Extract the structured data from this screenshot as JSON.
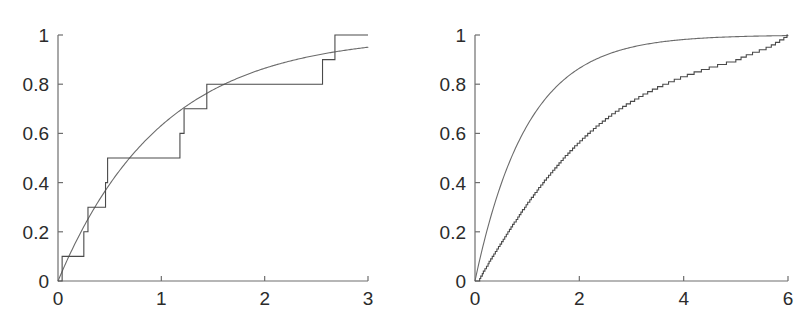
{
  "figure": {
    "title": "",
    "background_color": "#ffffff",
    "panel_count": 2,
    "axis_color": "#6e6e6e",
    "empirical_color": "#4a4a4a",
    "theoretical_color": "#6b6b6b"
  },
  "chart_data": [
    {
      "id": "left-panel",
      "type": "line",
      "title": "",
      "subtitle": "",
      "xlabel": "",
      "ylabel": "",
      "xlim": [
        0,
        3
      ],
      "ylim": [
        0,
        1
      ],
      "grid": false,
      "legend": "none",
      "xticks": [
        0,
        1,
        2,
        3
      ],
      "xticklabels": [
        "0",
        "1",
        "2",
        "3"
      ],
      "yticks": [
        0,
        0.2,
        0.4,
        0.6,
        0.8,
        1
      ],
      "yticklabels": [
        "0",
        "0.2",
        "0.4",
        "0.6",
        "0.8",
        "1"
      ],
      "series": [
        {
          "name": "empirical CDF (step)",
          "style": "step",
          "sample_size": 10,
          "jump_x": [
            0.04,
            0.25,
            0.29,
            0.46,
            0.48,
            1.18,
            1.22,
            1.44,
            2.56,
            2.68
          ],
          "step_values": [
            0.1,
            0.2,
            0.3,
            0.4,
            0.5,
            0.6,
            0.7,
            0.8,
            0.9,
            1.0
          ],
          "x": [
            0,
            0.04,
            0.04,
            0.25,
            0.25,
            0.29,
            0.29,
            0.46,
            0.46,
            0.48,
            0.48,
            1.18,
            1.18,
            1.22,
            1.22,
            1.44,
            1.44,
            2.56,
            2.56,
            2.68,
            2.68,
            3
          ],
          "y": [
            0,
            0,
            0.1,
            0.1,
            0.2,
            0.2,
            0.3,
            0.3,
            0.4,
            0.4,
            0.5,
            0.5,
            0.6,
            0.6,
            0.7,
            0.7,
            0.8,
            0.8,
            0.9,
            0.9,
            1.0,
            1.0
          ]
        },
        {
          "name": "theoretical CDF",
          "style": "smooth",
          "model": "exponential",
          "rate": 1.0,
          "x": [
            0,
            0.1,
            0.2,
            0.3,
            0.4,
            0.5,
            0.6,
            0.7,
            0.8,
            0.9,
            1.0,
            1.2,
            1.4,
            1.6,
            1.8,
            2.0,
            2.2,
            2.4,
            2.6,
            2.8,
            3.0
          ],
          "y": [
            0,
            0.095,
            0.181,
            0.259,
            0.33,
            0.393,
            0.451,
            0.503,
            0.551,
            0.593,
            0.632,
            0.699,
            0.753,
            0.798,
            0.835,
            0.865,
            0.889,
            0.909,
            0.926,
            0.939,
            0.95
          ]
        }
      ]
    },
    {
      "id": "right-panel",
      "type": "line",
      "title": "",
      "subtitle": "",
      "xlabel": "",
      "ylabel": "",
      "xlim": [
        0,
        6
      ],
      "ylim": [
        0,
        1
      ],
      "grid": false,
      "legend": "none",
      "xticks": [
        0,
        2,
        4,
        6
      ],
      "xticklabels": [
        "0",
        "2",
        "4",
        "6"
      ],
      "yticks": [
        0,
        0.2,
        0.4,
        0.6,
        0.8,
        1
      ],
      "yticklabels": [
        "0",
        "0.2",
        "0.4",
        "0.6",
        "0.8",
        "1"
      ],
      "series": [
        {
          "name": "empirical CDF (step)",
          "style": "step",
          "sample_size": 100,
          "jump_x": [
            0.09,
            0.11,
            0.14,
            0.16,
            0.19,
            0.22,
            0.25,
            0.27,
            0.3,
            0.33,
            0.36,
            0.39,
            0.42,
            0.45,
            0.48,
            0.51,
            0.54,
            0.57,
            0.6,
            0.63,
            0.66,
            0.69,
            0.72,
            0.75,
            0.79,
            0.82,
            0.85,
            0.88,
            0.91,
            0.95,
            0.98,
            1.01,
            1.05,
            1.08,
            1.12,
            1.15,
            1.19,
            1.22,
            1.26,
            1.3,
            1.33,
            1.37,
            1.41,
            1.45,
            1.49,
            1.53,
            1.57,
            1.61,
            1.65,
            1.69,
            1.73,
            1.78,
            1.82,
            1.87,
            1.91,
            1.96,
            2.01,
            2.06,
            2.11,
            2.16,
            2.21,
            2.27,
            2.32,
            2.38,
            2.44,
            2.5,
            2.56,
            2.62,
            2.69,
            2.76,
            2.83,
            2.9,
            2.98,
            3.06,
            3.14,
            3.22,
            3.31,
            3.4,
            3.5,
            3.6,
            3.71,
            3.82,
            3.94,
            4.07,
            4.2,
            4.34,
            4.49,
            4.65,
            4.82,
            5.0,
            5.1,
            5.2,
            5.32,
            5.45,
            5.58,
            5.68,
            5.76,
            5.84,
            5.92,
            5.98
          ],
          "description": "monotone staircase with 100 unit jumps of 0.01 closely tracking the exponential CDF"
        },
        {
          "name": "theoretical CDF",
          "style": "smooth",
          "model": "exponential",
          "rate": 1.0,
          "x": [
            0,
            0.2,
            0.4,
            0.6,
            0.8,
            1.0,
            1.4,
            1.8,
            2.2,
            2.6,
            3.0,
            3.5,
            4.0,
            4.5,
            5.0,
            5.5,
            6.0
          ],
          "y": [
            0,
            0.181,
            0.33,
            0.451,
            0.551,
            0.632,
            0.753,
            0.835,
            0.889,
            0.926,
            0.95,
            0.97,
            0.982,
            0.989,
            0.993,
            0.996,
            0.998
          ]
        }
      ]
    }
  ]
}
